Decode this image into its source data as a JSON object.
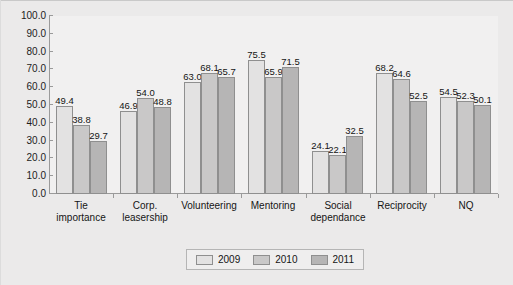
{
  "chart_data": {
    "type": "bar",
    "title": "",
    "subtitle": "",
    "xlabel": "",
    "ylabel": "",
    "ylim": [
      0,
      100
    ],
    "ytick_step": 10,
    "ytick_labels": [
      "100.0",
      "90.0",
      "80.0",
      "70.0",
      "60.0",
      "50.0",
      "40.0",
      "30.0",
      "20.0",
      "10.0",
      "0.0"
    ],
    "grid": false,
    "legend_position": "bottom-center",
    "categories": [
      "Tie\nimportance",
      "Corp.\nleasership",
      "Volunteering",
      "Mentoring",
      "Social\ndependance",
      "Reciprocity",
      "NQ"
    ],
    "series": [
      {
        "name": "2009",
        "color": "#e3e2e2",
        "values": [
          49.4,
          46.9,
          63.0,
          75.5,
          24.1,
          68.2,
          54.5
        ],
        "labels": [
          "49.4",
          "46.9",
          "63.0",
          "75.5",
          "24.1",
          "68.2",
          "54.5"
        ]
      },
      {
        "name": "2010",
        "color": "#c9c8c8",
        "values": [
          38.8,
          54.0,
          68.1,
          65.9,
          22.1,
          64.6,
          52.3
        ],
        "labels": [
          "38.8",
          "54.0",
          "68.1",
          "65.9",
          "22.1",
          "64.6",
          "52.3"
        ]
      },
      {
        "name": "2011",
        "color": "#b6b5b5",
        "values": [
          29.7,
          48.8,
          65.7,
          71.5,
          32.5,
          52.5,
          50.1
        ],
        "labels": [
          "29.7",
          "48.8",
          "65.7",
          "71.5",
          "32.5",
          "52.5",
          "50.1"
        ]
      }
    ]
  },
  "legend": {
    "entries": [
      {
        "label": "2009",
        "swatch": "s0"
      },
      {
        "label": "2010",
        "swatch": "s1"
      },
      {
        "label": "2011",
        "swatch": "s2"
      }
    ]
  }
}
